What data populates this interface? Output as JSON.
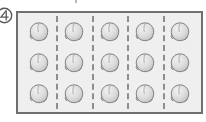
{
  "figure": {
    "title": "",
    "marker": {
      "icon": "circled-four-icon",
      "label": "4"
    },
    "tray": {
      "name": "fruit-tray",
      "columns": 5,
      "rows": 3,
      "total_items": 15,
      "divider_style": "dashed",
      "divider_count": 4,
      "item_icon": "peach-fruit-icon",
      "item_label": "peach",
      "border_color": "#6f6f6f",
      "fill_color": "#efefef",
      "divider_color": "#8e8e8e",
      "item_fill_color": "#dcdcdc",
      "item_stroke_color": "#7a7a7a"
    },
    "rows": [
      {
        "name": "row-1",
        "items": [
          "peach",
          "peach",
          "peach",
          "peach",
          "peach"
        ]
      },
      {
        "name": "row-2",
        "items": [
          "peach",
          "peach",
          "peach",
          "peach",
          "peach"
        ]
      },
      {
        "name": "row-3",
        "items": [
          "peach",
          "peach",
          "peach",
          "peach",
          "peach"
        ]
      }
    ]
  }
}
